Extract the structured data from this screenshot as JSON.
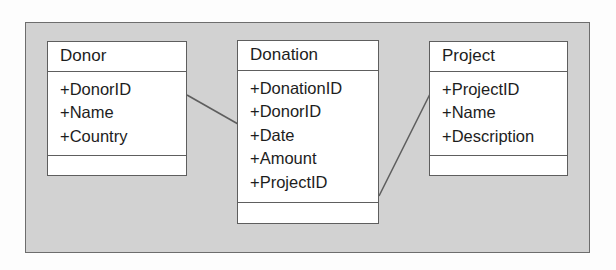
{
  "diagram": {
    "type": "uml-class-diagram",
    "frame": {
      "fill_color": "#d2d2d2",
      "border_color": "#6d6d6d"
    },
    "classes": [
      {
        "id": "donor",
        "name": "Donor",
        "attributes": [
          "+DonorID",
          "+Name",
          "+Country"
        ],
        "operations": []
      },
      {
        "id": "donation",
        "name": "Donation",
        "attributes": [
          "+DonationID",
          "+DonorID",
          "+Date",
          "+Amount",
          "+ProjectID"
        ],
        "operations": []
      },
      {
        "id": "project",
        "name": "Project",
        "attributes": [
          "+ProjectID",
          "+Name",
          "+Description"
        ],
        "operations": []
      }
    ],
    "associations": [
      {
        "id": "donor-donation",
        "from": "donor",
        "to": "donation",
        "label": ""
      },
      {
        "id": "donation-project",
        "from": "donation",
        "to": "project",
        "label": ""
      }
    ]
  }
}
